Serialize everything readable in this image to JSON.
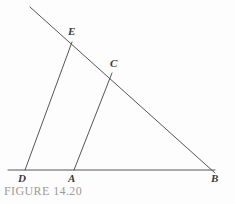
{
  "figure": {
    "caption": "FIGURE 14.20",
    "line_color": "#55555a",
    "label_color": "#3a3a3f",
    "caption_color": "#9d9a97",
    "background_color": "#fdfdfd",
    "labels": {
      "E": "E",
      "C": "C",
      "D": "D",
      "A": "A",
      "B": "B"
    },
    "geometry": {
      "points": {
        "D": [
          25,
          170
        ],
        "A": [
          74,
          170
        ],
        "B": [
          212,
          170
        ],
        "C": [
          110,
          78
        ],
        "E": [
          70,
          47
        ],
        "ray_start": [
          30,
          7
        ],
        "baseline_left": [
          8,
          170
        ]
      },
      "segments": [
        {
          "name": "baseline-DB",
          "from": [
            8,
            170
          ],
          "to": [
            215,
            170
          ]
        },
        {
          "name": "transversal-ray-EB",
          "from": [
            30,
            7
          ],
          "to": [
            215,
            173
          ]
        },
        {
          "name": "segment-DE",
          "from": [
            25,
            170
          ],
          "to": [
            72,
            42
          ]
        },
        {
          "name": "segment-AC",
          "from": [
            74,
            170
          ],
          "to": [
            112,
            73
          ]
        }
      ]
    }
  }
}
